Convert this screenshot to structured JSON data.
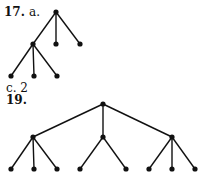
{
  "problem17": {
    "number": "17.",
    "part_a": "a.",
    "part_c": "c. 2",
    "tree": {
      "nodes": [
        [
          56,
          12
        ],
        [
          33,
          44
        ],
        [
          56,
          44
        ],
        [
          80,
          44
        ],
        [
          11,
          76
        ],
        [
          34,
          76
        ],
        [
          57,
          76
        ]
      ],
      "edges": [
        [
          0,
          1
        ],
        [
          0,
          2
        ],
        [
          0,
          3
        ],
        [
          1,
          4
        ],
        [
          1,
          5
        ],
        [
          1,
          6
        ]
      ]
    }
  },
  "problem19": {
    "number": "19.",
    "tree": {
      "nodes": [
        [
          103,
          104
        ],
        [
          33,
          137
        ],
        [
          103,
          137
        ],
        [
          172,
          137
        ],
        [
          11,
          169
        ],
        [
          34,
          169
        ],
        [
          57,
          169
        ],
        [
          80,
          169
        ],
        [
          126,
          169
        ],
        [
          149,
          169
        ],
        [
          172,
          169
        ],
        [
          195,
          169
        ]
      ],
      "edges": [
        [
          0,
          1
        ],
        [
          0,
          2
        ],
        [
          0,
          3
        ],
        [
          1,
          4
        ],
        [
          1,
          5
        ],
        [
          1,
          6
        ],
        [
          2,
          7
        ],
        [
          2,
          8
        ],
        [
          3,
          9
        ],
        [
          3,
          10
        ],
        [
          3,
          11
        ]
      ]
    }
  }
}
